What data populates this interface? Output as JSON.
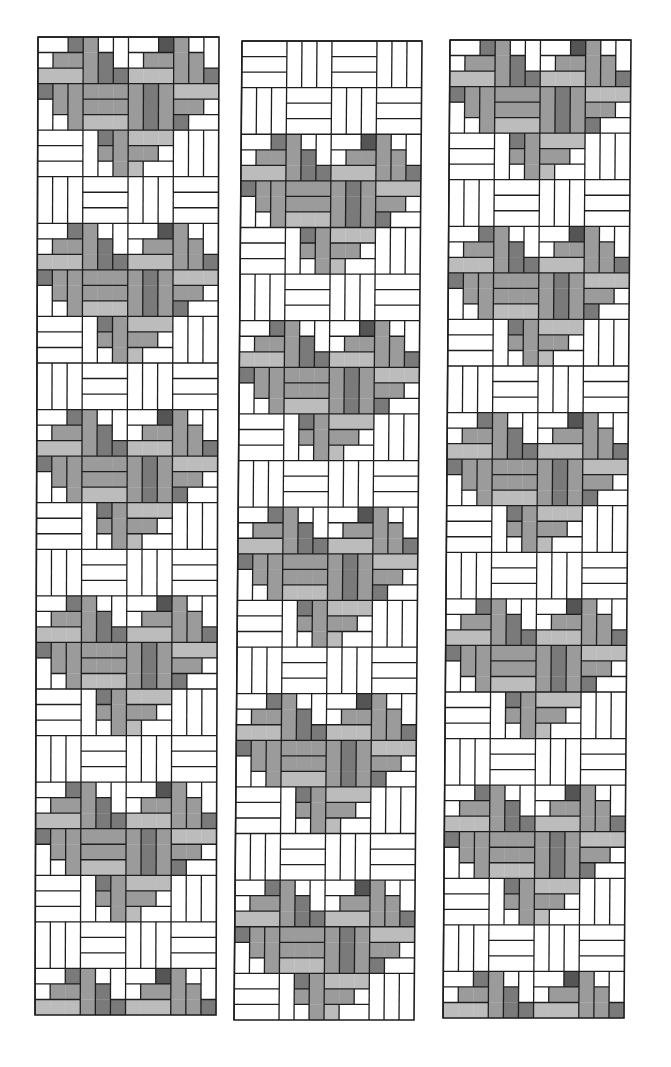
{
  "figure": {
    "colors": {
      "W": "#ffffff",
      "L": "#bcbcbc",
      "M": "#9b9b9b",
      "D": "#7a7a7a",
      "X": "#555555",
      "line": "#1e1e1e"
    },
    "block_px": 46.5,
    "cols": 4,
    "rows": 21,
    "heart_period_rows": 4,
    "heart_rows": 3,
    "heart_units": [
      "WWDMWWWWXMWW",
      "WMMMDWWMMMMW",
      "LLLMDDLLLMMD",
      "DMMMMMMDMLLL",
      "WMMMMMMDMMMW",
      "WWMLLLMDMDWW",
      "WWWWDMLLLWWW",
      "WWWWMMMMWWWW",
      "WWWWWMLWWWWW"
    ],
    "strips": [
      {
        "name": "left-strip",
        "x_top": 38,
        "y_top": 37,
        "x_bottom": 41,
        "width": 181,
        "height": 978,
        "heart_offset_rows": 0
      },
      {
        "name": "middle-strip",
        "x_top": 242,
        "y_top": 41,
        "x_bottom": 250,
        "width": 180,
        "height": 979,
        "heart_offset_rows": 2
      },
      {
        "name": "right-strip",
        "x_top": 450,
        "y_top": 40,
        "x_bottom": 457,
        "width": 181,
        "height": 978,
        "heart_offset_rows": 0
      }
    ]
  }
}
